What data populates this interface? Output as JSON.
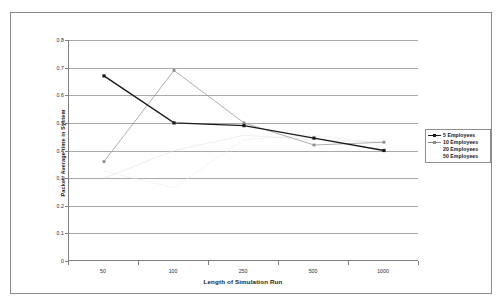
{
  "chart_data": {
    "type": "line",
    "title": "",
    "xlabel": "Length of Simulation Run",
    "ylabel": "Packet: Average time in System",
    "x": [
      50,
      100,
      250,
      500,
      1000
    ],
    "categories": [
      "50",
      "100",
      "250",
      "500",
      "1000"
    ],
    "xtick_labels": [
      "50",
      "100",
      "250",
      "500",
      "1000"
    ],
    "ytick_labels": [
      "0.8",
      "0.7",
      "0.6",
      "0.5",
      "0.4",
      "0.3",
      "0.2",
      "0.1",
      "0"
    ],
    "ytick_values": [
      0.8,
      0.7,
      0.6,
      0.5,
      0.4,
      0.3,
      0.2,
      0.1,
      0
    ],
    "ylim": [
      0,
      0.8
    ],
    "grid": "horizontal",
    "legend_position": "right",
    "series": [
      {
        "name": "5 Employees",
        "color": "#1a1a1a",
        "marker": "square",
        "values": [
          0.67,
          0.5,
          0.49,
          0.445,
          0.4
        ]
      },
      {
        "name": "10 Employees",
        "color": "#8c8c8c",
        "marker": "square",
        "values": [
          0.36,
          0.69,
          0.5,
          0.42,
          0.43
        ]
      },
      {
        "name": "20 Employees",
        "color": "#e2e2e2",
        "marker": "none",
        "values": [
          0.3,
          0.4,
          0.455,
          0.44,
          0.43
        ]
      },
      {
        "name": "50 Employees",
        "color": "#ededed",
        "marker": "none",
        "values": [
          0.325,
          0.265,
          0.44,
          0.455,
          0.425
        ]
      }
    ]
  },
  "legend": {
    "items": [
      {
        "label": "5 Employees",
        "color": "#1a1a1a",
        "show_key": true
      },
      {
        "label": "10 Employees",
        "color": "#8c8c8c",
        "show_key": true
      },
      {
        "label": "20 Employees",
        "color": "#ffffff",
        "show_key": false
      },
      {
        "label": "50 Employees",
        "color": "#ffffff",
        "show_key": false
      }
    ]
  }
}
